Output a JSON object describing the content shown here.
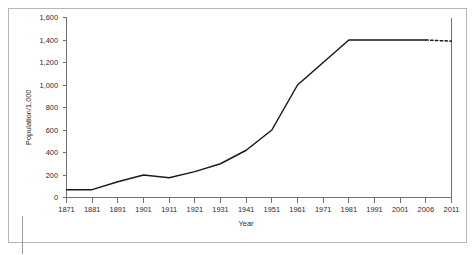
{
  "chart_data": {
    "type": "line",
    "title": "",
    "xlabel": "Year",
    "ylabel": "Population/1,000",
    "categories": [
      "1871",
      "1881",
      "1891",
      "1901",
      "1911",
      "1921",
      "1931",
      "1941",
      "1951",
      "1961",
      "1971",
      "1981",
      "1991",
      "2001",
      "2006",
      "2011"
    ],
    "values": [
      70,
      70,
      140,
      200,
      175,
      230,
      300,
      420,
      600,
      1000,
      1200,
      1400,
      1400,
      1400,
      1400,
      1390
    ],
    "series": [
      {
        "name": "Population",
        "values": [
          70,
          70,
          140,
          200,
          175,
          230,
          300,
          420,
          600,
          1000,
          1200,
          1400,
          1400,
          1400,
          1400,
          1390
        ],
        "style": "solid-with-dashed-tail",
        "dashed_from_category": "2006",
        "color": "#1a1a1a"
      }
    ],
    "ylim": [
      0,
      1600
    ],
    "ytick_values": [
      0,
      200,
      400,
      600,
      800,
      1000,
      1200,
      1400,
      1600
    ],
    "ytick_labels": [
      "0",
      "200",
      "400",
      "600",
      "800",
      "1,000",
      "1,200",
      "1,400",
      "1,600"
    ],
    "xtick_labels": [
      "1871",
      "1881",
      "1891",
      "1901",
      "1911",
      "1921",
      "1931",
      "1941",
      "1951",
      "1961",
      "1971",
      "1981",
      "1991",
      "2001",
      "2006",
      "2011"
    ],
    "grid": false,
    "legend": null,
    "annotations": [
      "Final segment from 2006 to 2011 is drawn as a dashed projection."
    ]
  },
  "figure": {
    "frame_color": "#b6b6b6",
    "axis_color": "#6f6f6f",
    "line_color": "#1a1a1a",
    "background": "#ffffff"
  }
}
